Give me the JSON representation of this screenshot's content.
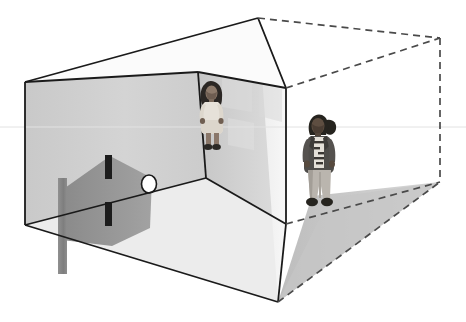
{
  "image": {
    "title": "Perspective room diagram with two standing figures",
    "type": "line-drawing-with-photo-cutouts",
    "width": 466,
    "height": 322,
    "background_color": "#ffffff"
  },
  "palette": {
    "outline": "#1a1a1a",
    "dashed_outline": "#4a4a4a",
    "left_wall": "#d2d2d2",
    "back_wall_left": "#cfcfcf",
    "back_wall_right": "#e6e6e6",
    "right_wall": "#f0f0f0",
    "floor": "#ececec",
    "floor_shadow": "#c9c9c9",
    "panel_shadow": "#8f8f8f",
    "slot_dark": "#1c1c1c",
    "circle_fill": "#ffffff",
    "ghost_panel": "#dcdcdc"
  },
  "geometry": {
    "apex_top": {
      "x": 258,
      "y": 18
    },
    "left_top_corner": {
      "x": 25,
      "y": 82
    },
    "left_bottom_corner": {
      "x": 25,
      "y": 225
    },
    "bottom_corner": {
      "x": 278,
      "y": 302
    },
    "inner_corner_top": {
      "x": 286,
      "y": 88
    },
    "inner_corner_bottom": {
      "x": 286,
      "y": 224
    },
    "dashed_right_top": {
      "x": 440,
      "y": 38
    },
    "dashed_right_bottom": {
      "x": 440,
      "y": 182
    },
    "back_wall_fold_top": {
      "x": 198,
      "y": 72
    },
    "back_wall_fold_bottom": {
      "x": 206,
      "y": 178
    }
  },
  "elements": {
    "room_box": {
      "name": "Perspective room box",
      "description": "Open cuboid room drawn in two-point perspective with solid black edges"
    },
    "dashed_extension": {
      "name": "Dashed volume extension",
      "description": "Wireframe dashed extension of the room volume to the right"
    },
    "floor_shadow": {
      "name": "Floor shadow triangle",
      "description": "Gray shaded triangular region on the extended floor plane"
    },
    "dark_slot": {
      "name": "Vertical dark slot",
      "description": "Narrow black vertical opening on the left wall"
    },
    "shadow_panel": {
      "name": "Projected shadow panel",
      "description": "Large gray quadrilateral projecting from the slot toward the viewer"
    },
    "vertical_post": {
      "name": "Gray vertical post",
      "description": "Narrow vertical gray bar in front of the left wall"
    },
    "white_circle": {
      "name": "White circle marker",
      "description": "Small white circle outlined in black on the floor area"
    },
    "ghost_windows": {
      "name": "Faint window panels",
      "description": "Two faint light rectangles suggesting windows on the back right wall"
    },
    "horizon_line": {
      "name": "Horizon construction line",
      "description": "Faint horizontal construction line crossing the scene"
    }
  },
  "figures": [
    {
      "id": "figure-a",
      "name": "child-in-light-dress",
      "label": "Child standing in back corner",
      "position": {
        "x": 196,
        "y": 80
      },
      "size": {
        "width": 32,
        "height": 72
      },
      "hair": "dark long hair",
      "clothing": "light cream dress",
      "footwear": "dark sandals"
    },
    {
      "id": "figure-b",
      "name": "child-in-dark-jacket",
      "label": "Child standing against right wall",
      "position": {
        "x": 299,
        "y": 110
      },
      "size": {
        "width": 43,
        "height": 98
      },
      "hair": "dark hair with ponytail",
      "clothing": "dark jacket over patterned shirt, light pants",
      "footwear": "dark sneakers"
    }
  ]
}
